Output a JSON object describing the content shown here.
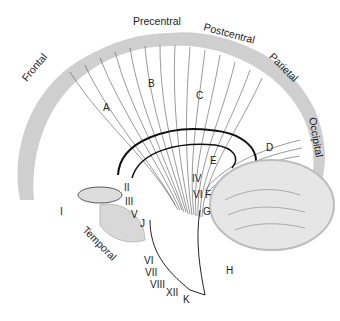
{
  "diagram": {
    "colors": {
      "cortex": "#cfcfcf",
      "fibers": "#555555",
      "outline": "#111111",
      "cerebellum": "#bdbdbd"
    },
    "lobes": [
      {
        "id": "frontal",
        "label": "Frontal"
      },
      {
        "id": "precentral",
        "label": "Precentral"
      },
      {
        "id": "postcentral",
        "label": "Postcentral"
      },
      {
        "id": "parietal",
        "label": "Parietal"
      },
      {
        "id": "occipital",
        "label": "Occipital"
      },
      {
        "id": "temporal",
        "label": "Temporal"
      }
    ],
    "tract_labels": [
      "A",
      "B",
      "C",
      "D",
      "E",
      "F",
      "G",
      "H",
      "J",
      "K"
    ],
    "nerve_labels": [
      "I",
      "II",
      "III",
      "IV",
      "V",
      "VI",
      "VII",
      "VIII",
      "XII"
    ]
  }
}
